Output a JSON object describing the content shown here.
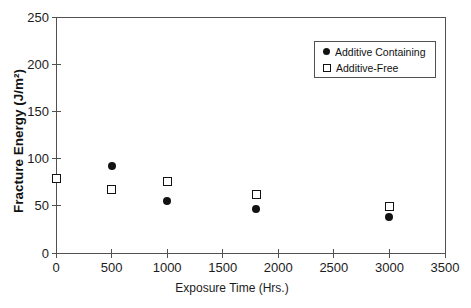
{
  "chart_data": {
    "type": "scatter",
    "title": "",
    "xlabel": "Exposure Time (Hrs.)",
    "ylabel": "Fracture Energy (J/m²)",
    "xlim": [
      0,
      3500
    ],
    "ylim": [
      0,
      250
    ],
    "xticks": [
      0,
      500,
      1000,
      1500,
      2000,
      2500,
      3000,
      3500
    ],
    "yticks": [
      0,
      50,
      100,
      150,
      200,
      250
    ],
    "grid": false,
    "legend_position": "top-right-inside",
    "series": [
      {
        "name": "Additive Containing",
        "marker": "filled-circle",
        "color": "#121212",
        "points": [
          [
            500,
            92
          ],
          [
            1000,
            55
          ],
          [
            1800,
            47
          ],
          [
            3000,
            38
          ]
        ]
      },
      {
        "name": "Additive-Free",
        "marker": "open-square",
        "color": "#121212",
        "points": [
          [
            0,
            79
          ],
          [
            500,
            67
          ],
          [
            1000,
            76
          ],
          [
            1800,
            62
          ],
          [
            3000,
            49
          ]
        ]
      }
    ]
  },
  "colors": {
    "background": "#ffffff",
    "axis": "#515151",
    "marker": "#121212",
    "text": "#1c1c1c"
  }
}
